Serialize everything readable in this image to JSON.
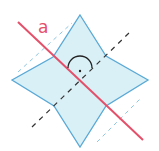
{
  "diagram": {
    "colors": {
      "star_fill": "#d9f0f7",
      "star_stroke": "#5aa9d6",
      "axis_line": "#e4506a",
      "dashed_black": "#333333",
      "dashed_blue": "#8ec6e4",
      "background": "#ffffff"
    },
    "labels": {
      "axis": "a"
    },
    "symbols": {
      "right_angle": "arc-with-dot"
    }
  }
}
